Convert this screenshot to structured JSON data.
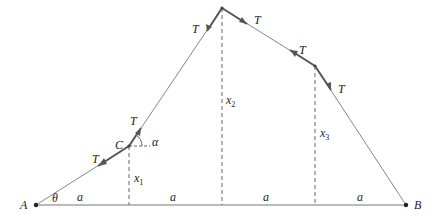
{
  "diagram": {
    "points": {
      "A": {
        "label": "A",
        "x": 36,
        "y": 205
      },
      "C": {
        "label": "C",
        "x": 129,
        "y": 146
      },
      "P2": {
        "x": 222,
        "y": 8
      },
      "P3": {
        "x": 315,
        "y": 66
      },
      "B": {
        "label": "B",
        "x": 406,
        "y": 205
      }
    },
    "labels": {
      "A": "A",
      "B": "B",
      "C": "C",
      "theta": "θ",
      "alpha": "α",
      "tension": "T",
      "x": "x",
      "x1_sub": "1",
      "x2_sub": "2",
      "x3_sub": "3",
      "spacing": "a"
    },
    "colors": {
      "line": "#777777",
      "heavy": "#555555",
      "text": "#222222"
    }
  }
}
